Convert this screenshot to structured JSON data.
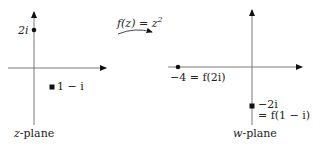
{
  "mapping": {
    "label_pre": "f(z) = z",
    "exponent": "2"
  },
  "z_plane": {
    "caption_var": "z",
    "caption_rest": "-plane",
    "points": [
      {
        "label": "2i",
        "marker": "dot"
      },
      {
        "label": "1 − i",
        "marker": "square"
      }
    ]
  },
  "w_plane": {
    "caption_var": "w",
    "caption_rest": "-plane",
    "points": [
      {
        "label": "−4 = f(2i)",
        "marker": "dot"
      },
      {
        "label_line1": "−2i",
        "label_line2": "= f(1 − i)",
        "marker": "square"
      }
    ]
  },
  "colors": {
    "axis": "#7a7a7a",
    "ink": "#111111"
  }
}
